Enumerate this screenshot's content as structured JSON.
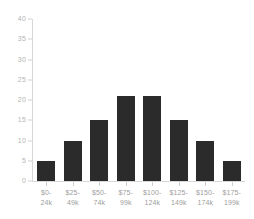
{
  "chart_data": {
    "type": "bar",
    "title": "",
    "subtitle": "",
    "xlabel": "",
    "ylabel": "",
    "categories": [
      "$0-\n24k",
      "$25-\n49k",
      "$50-\n74k",
      "$75-\n99k",
      "$100-\n124k",
      "$125-\n149k",
      "$150-\n174k",
      "$175-\n199k"
    ],
    "category_lines": [
      [
        "$0-",
        "24k"
      ],
      [
        "$25-",
        "49k"
      ],
      [
        "$50-",
        "74k"
      ],
      [
        "$75-",
        "99k"
      ],
      [
        "$100-",
        "124k"
      ],
      [
        "$125-",
        "149k"
      ],
      [
        "$150-",
        "174k"
      ],
      [
        "$175-",
        "199k"
      ]
    ],
    "values": [
      5,
      10,
      15,
      21,
      21,
      15,
      10,
      5
    ],
    "ylim": [
      0,
      40
    ],
    "yticks": [
      0,
      5,
      10,
      15,
      20,
      25,
      30,
      35,
      40
    ],
    "ytick_labels": [
      "0",
      "5",
      "10",
      "15",
      "20",
      "25",
      "30",
      "35",
      "40"
    ],
    "grid": false,
    "legend": null,
    "bar_color": "#2b2b2b",
    "axis_color": "#d8d8d8",
    "tick_label_color": "#b4b4b4",
    "xtick_label_color": "#9e9e9e",
    "background_color": "#ffffff"
  }
}
